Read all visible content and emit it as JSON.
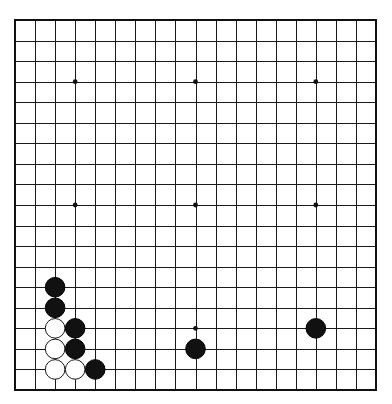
{
  "board": {
    "size": 19,
    "origin": {
      "x": 15,
      "y": 20
    },
    "end": {
      "x": 376,
      "y": 390
    },
    "background_color": "#ffffff",
    "line_color": "#1a1a1a",
    "stone_radius": 9.8
  },
  "star_points": [
    {
      "col": 3,
      "row": 3
    },
    {
      "col": 9,
      "row": 3
    },
    {
      "col": 15,
      "row": 3
    },
    {
      "col": 3,
      "row": 9
    },
    {
      "col": 9,
      "row": 9
    },
    {
      "col": 15,
      "row": 9
    },
    {
      "col": 3,
      "row": 15
    },
    {
      "col": 9,
      "row": 15
    },
    {
      "col": 15,
      "row": 15
    }
  ],
  "stones": [
    {
      "color": "black",
      "col": 2,
      "row": 13
    },
    {
      "color": "black",
      "col": 2,
      "row": 14
    },
    {
      "color": "white",
      "col": 2,
      "row": 15
    },
    {
      "color": "black",
      "col": 3,
      "row": 15
    },
    {
      "color": "white",
      "col": 2,
      "row": 16
    },
    {
      "color": "black",
      "col": 3,
      "row": 16
    },
    {
      "color": "white",
      "col": 2,
      "row": 17
    },
    {
      "color": "white",
      "col": 3,
      "row": 17
    },
    {
      "color": "black",
      "col": 4,
      "row": 17
    },
    {
      "color": "black",
      "col": 9,
      "row": 16
    },
    {
      "color": "black",
      "col": 15,
      "row": 15
    }
  ]
}
